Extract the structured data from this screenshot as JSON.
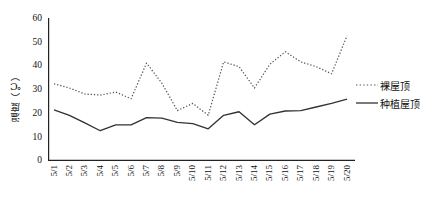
{
  "chart_data": {
    "type": "line",
    "title": "",
    "xlabel": "",
    "ylabel": "温度（℃）",
    "ylim": [
      0,
      60
    ],
    "yticks": [
      0,
      10,
      20,
      30,
      40,
      50,
      60
    ],
    "grid": false,
    "legend_position": "right",
    "categories": [
      "5/1",
      "5/2",
      "5/3",
      "5/4",
      "5/5",
      "5/6",
      "5/7",
      "5/8",
      "5/9",
      "5/10",
      "5/11",
      "5/12",
      "5/13",
      "5/14",
      "5/15",
      "5/16",
      "5/17",
      "5/18",
      "5/19",
      "5/20"
    ],
    "series": [
      {
        "name": "裸屋顶",
        "style": "dotted",
        "color": "#555555",
        "values": [
          32.3,
          30.5,
          28.0,
          27.5,
          28.8,
          26.0,
          41.0,
          32.5,
          21.0,
          24.0,
          19.0,
          41.5,
          39.5,
          30.5,
          40.5,
          45.8,
          41.5,
          39.5,
          36.5,
          52.5
        ]
      },
      {
        "name": "种植屋顶",
        "style": "solid",
        "color": "#333333",
        "values": [
          21.3,
          19.0,
          15.8,
          12.5,
          15.0,
          15.0,
          18.0,
          17.8,
          16.0,
          15.5,
          13.3,
          19.0,
          20.5,
          15.0,
          19.5,
          20.8,
          21.0,
          22.5,
          24.0,
          25.8
        ]
      }
    ]
  },
  "legend": {
    "items": [
      {
        "label": "裸屋顶",
        "marker": "dotted-line-marker"
      },
      {
        "label": "种植屋顶",
        "marker": "solid-line-marker"
      }
    ]
  }
}
